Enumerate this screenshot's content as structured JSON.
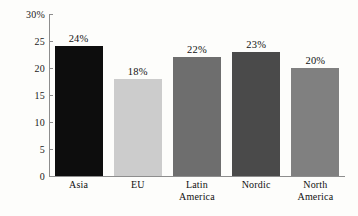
{
  "chart_data": {
    "type": "bar",
    "title": "",
    "xlabel": "",
    "ylabel": "",
    "categories": [
      "Asia",
      "EU",
      "Latin America",
      "Nordic",
      "North America"
    ],
    "category_lines": [
      [
        "Asia"
      ],
      [
        "EU"
      ],
      [
        "Latin",
        "America"
      ],
      [
        "Nordic"
      ],
      [
        "North",
        "America"
      ]
    ],
    "values": [
      24,
      18,
      22,
      23,
      20
    ],
    "data_labels": [
      "24%",
      "18%",
      "22%",
      "23%",
      "20%"
    ],
    "bar_colors": [
      "#0d0d0d",
      "#cccccc",
      "#6e6e6e",
      "#4a4a4a",
      "#808080"
    ],
    "ylim": [
      0,
      30
    ],
    "yticks": [
      0,
      5,
      10,
      15,
      20,
      25,
      30
    ],
    "ytick_labels": [
      "0",
      "5",
      "10",
      "15",
      "20",
      "25",
      "30%"
    ],
    "grid": false,
    "legend": "none",
    "axis_color": "#8d8d8d",
    "background": "#fdfdfb"
  }
}
